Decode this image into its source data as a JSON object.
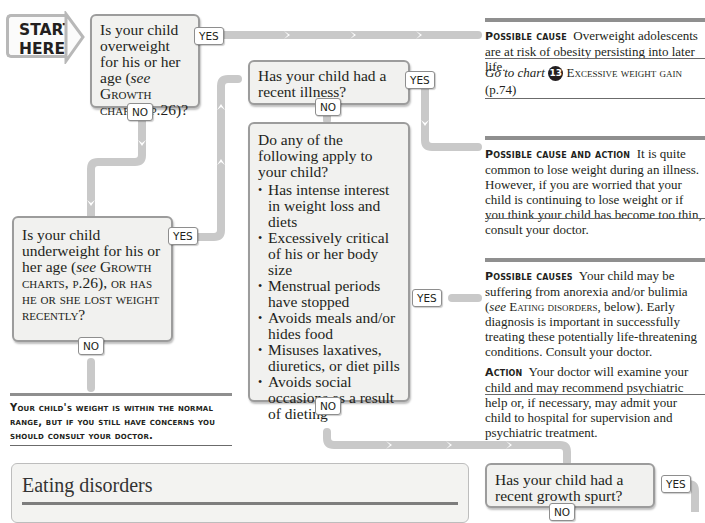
{
  "start": {
    "line1": "START",
    "line2": "HERE"
  },
  "q1": {
    "text_a": "Is your child overweight for his or her age (",
    "see": "see",
    "text_b": " Growth charts, p.26)?",
    "yes": "YES",
    "no": "NO"
  },
  "q2": {
    "text": "Has your child had a recent illness?",
    "yes": "YES",
    "no": "NO"
  },
  "q3": {
    "intro": "Do any of the following apply to your child?",
    "items": [
      "Has intense interest in weight loss and diets",
      "Excessively critical of his or her body size",
      "Menstrual periods have stopped",
      "Avoids meals and/or hides food",
      "Misuses laxatives, diuretics, or diet pills",
      "Avoids social occasions as a result of dieting"
    ],
    "yes": "YES",
    "no": "NO"
  },
  "q4": {
    "text_a": "Is your child underweight for his or her age (",
    "see": "see",
    "text_b": " Growth charts, p.26), or has he or she lost weight recently?",
    "yes": "YES",
    "no": "NO"
  },
  "q5": {
    "text": "Has your child had a recent growth spurt?",
    "yes": "YES",
    "no": "NO"
  },
  "panel1": {
    "label": "Possible cause",
    "text": "Overweight adolescents are at risk of obesity persisting into later life.",
    "goto_prefix": "Go to chart",
    "chart_number": "13",
    "goto_title": "Excessive weight gain",
    "goto_page": "(p.74)"
  },
  "panel2": {
    "label": "Possible cause and action",
    "text": "It is quite common to lose weight during an illness. However, if you are worried that your child is continuing to lose weight or if you think your child has become too thin, consult your doctor."
  },
  "panel3": {
    "label1": "Possible causes",
    "text1a": "Your child may be suffering from anorexia and/or bulimia (",
    "see": "see",
    "text1b": " Eating disorders",
    "text1c": ", below). Early diagnosis is important in successfully treating these potentially life-threatening conditions. Consult your doctor.",
    "label2": "Action",
    "text2": "Your doctor will examine your child and may recommend psychiatric help or, if necessary, may admit your child to hospital for supervision and psychiatric treatment."
  },
  "normal_note": "Your child's weight is within the normal range, but if you still have concerns you should consult your doctor.",
  "eating_disorders": {
    "title": "Eating disorders"
  },
  "colors": {
    "path": "#c9c9c9",
    "box_bg": "#f1f1ef",
    "box_border": "#9c9c9c",
    "rule": "#8f8f8f",
    "text": "#231f20"
  }
}
